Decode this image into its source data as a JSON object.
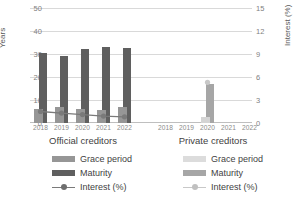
{
  "chart_data": {
    "type": "bar",
    "title": "",
    "subtitle": "",
    "xlabel": "",
    "ylabel": "Years",
    "y2label": "Interest (%)",
    "ylim": [
      0,
      50
    ],
    "y2lim": [
      0,
      15
    ],
    "yticks": [
      "0",
      "10",
      "20",
      "30",
      "40",
      "50"
    ],
    "ytick_values": [
      0,
      10,
      20,
      30,
      40,
      50
    ],
    "y2ticks": [
      "0",
      "3",
      "6",
      "9",
      "12",
      "15"
    ],
    "y2tick_values": [
      0,
      3,
      6,
      9,
      12,
      15
    ],
    "grid": true,
    "legend_position": "bottom",
    "groups": [
      {
        "name": "official",
        "label": "Official creditors",
        "categories": [
          "2018",
          "2019",
          "2020",
          "2021",
          "2022"
        ],
        "series": [
          {
            "name": "Grace period",
            "axis": "left",
            "values": [
              6.3,
              6.8,
              6.2,
              5.6,
              6.8
            ]
          },
          {
            "name": "Maturity",
            "axis": "left",
            "values": [
              30.5,
              29.0,
              32.0,
              33.0,
              32.5
            ]
          },
          {
            "name": "Interest (%)",
            "axis": "right",
            "values": [
              1.5,
              1.3,
              1.1,
              0.9,
              0.8
            ]
          }
        ],
        "legend": [
          "Grace period",
          "Maturity",
          "Interest (%)"
        ],
        "colors": {
          "grace": "#969696",
          "maturity": "#5f5f5f",
          "interest": "#7a7a7a"
        }
      },
      {
        "name": "private",
        "label": "Private creditors",
        "categories": [
          "2018",
          "2019",
          "2020",
          "2021",
          "2022"
        ],
        "series": [
          {
            "name": "Grace period",
            "axis": "left",
            "values": [
              0,
              0,
              2.5,
              0,
              0
            ]
          },
          {
            "name": "Maturity",
            "axis": "left",
            "values": [
              0,
              0,
              17.0,
              0,
              0
            ]
          },
          {
            "name": "Interest (%)",
            "axis": "right",
            "values": [
              null,
              null,
              5.3,
              null,
              null
            ]
          }
        ],
        "legend": [
          "Grace period",
          "Maturity",
          "Interest (%)"
        ],
        "colors": {
          "grace": "#dcdcdc",
          "maturity": "#a6a6a6",
          "interest": "#c8c8c8"
        }
      }
    ]
  }
}
